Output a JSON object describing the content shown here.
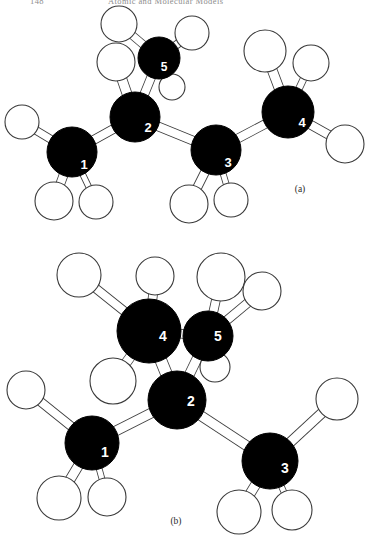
{
  "page": {
    "width": 376,
    "height": 552,
    "background": "#ffffff",
    "ink": "#000000",
    "outline": "#3a3a3a"
  },
  "running_head": {
    "folio": "148",
    "title": "Atomic and Molecular Models"
  },
  "figures": [
    {
      "id": "figure-a",
      "caption": "(a)",
      "caption_x": 300,
      "caption_y": 192,
      "carbon_radius_default": 24,
      "hydrogen_radius_default": 19,
      "carbons": [
        {
          "label": "1",
          "x": 72,
          "y": 152,
          "r": 25,
          "lx": 84,
          "ly": 164,
          "fs": 13
        },
        {
          "label": "2",
          "x": 135,
          "y": 117,
          "r": 25,
          "lx": 148,
          "ly": 127,
          "fs": 13
        },
        {
          "label": "3",
          "x": 216,
          "y": 150,
          "r": 25,
          "lx": 228,
          "ly": 162,
          "fs": 13
        },
        {
          "label": "4",
          "x": 288,
          "y": 112,
          "r": 26,
          "lx": 302,
          "ly": 122,
          "fs": 13
        },
        {
          "label": "5",
          "x": 159,
          "y": 58,
          "r": 21,
          "lx": 164,
          "ly": 67,
          "fs": 12
        }
      ],
      "hydrogens": [
        {
          "x": 22,
          "y": 122,
          "r": 17
        },
        {
          "x": 54,
          "y": 201,
          "r": 19
        },
        {
          "x": 96,
          "y": 202,
          "r": 17
        },
        {
          "x": 116,
          "y": 62,
          "r": 19
        },
        {
          "x": 119,
          "y": 24,
          "r": 18
        },
        {
          "x": 192,
          "y": 33,
          "r": 17
        },
        {
          "x": 172,
          "y": 87,
          "r": 13
        },
        {
          "x": 189,
          "y": 204,
          "r": 19
        },
        {
          "x": 231,
          "y": 200,
          "r": 17
        },
        {
          "x": 265,
          "y": 51,
          "r": 21
        },
        {
          "x": 311,
          "y": 63,
          "r": 18
        },
        {
          "x": 345,
          "y": 144,
          "r": 19
        }
      ],
      "bonds": [
        {
          "a": [
            72,
            152
          ],
          "b": [
            22,
            122
          ],
          "w": 7
        },
        {
          "a": [
            72,
            152
          ],
          "b": [
            54,
            201
          ],
          "w": 8
        },
        {
          "a": [
            72,
            152
          ],
          "b": [
            96,
            202
          ],
          "w": 5
        },
        {
          "a": [
            72,
            152
          ],
          "b": [
            135,
            117
          ],
          "w": 8
        },
        {
          "a": [
            135,
            117
          ],
          "b": [
            116,
            62
          ],
          "w": 9
        },
        {
          "a": [
            135,
            117
          ],
          "b": [
            159,
            58
          ],
          "w": 8
        },
        {
          "a": [
            159,
            58
          ],
          "b": [
            119,
            24
          ],
          "w": 7
        },
        {
          "a": [
            159,
            58
          ],
          "b": [
            192,
            33
          ],
          "w": 7
        },
        {
          "a": [
            159,
            58
          ],
          "b": [
            172,
            87
          ],
          "w": 6
        },
        {
          "a": [
            135,
            117
          ],
          "b": [
            216,
            150
          ],
          "w": 8
        },
        {
          "a": [
            216,
            150
          ],
          "b": [
            189,
            204
          ],
          "w": 8
        },
        {
          "a": [
            216,
            150
          ],
          "b": [
            231,
            200
          ],
          "w": 5
        },
        {
          "a": [
            216,
            150
          ],
          "b": [
            288,
            112
          ],
          "w": 8
        },
        {
          "a": [
            288,
            112
          ],
          "b": [
            265,
            51
          ],
          "w": 9
        },
        {
          "a": [
            288,
            112
          ],
          "b": [
            311,
            63
          ],
          "w": 6
        },
        {
          "a": [
            288,
            112
          ],
          "b": [
            345,
            144
          ],
          "w": 8
        }
      ]
    },
    {
      "id": "figure-b",
      "caption": "(b)",
      "caption_x": 176,
      "caption_y": 524,
      "carbon_radius_default": 27,
      "hydrogen_radius_default": 20,
      "carbons": [
        {
          "label": "1",
          "x": 92,
          "y": 443,
          "r": 27,
          "lx": 105,
          "ly": 452,
          "fs": 14
        },
        {
          "label": "2",
          "x": 177,
          "y": 400,
          "r": 29,
          "lx": 191,
          "ly": 401,
          "fs": 14
        },
        {
          "label": "3",
          "x": 270,
          "y": 461,
          "r": 28,
          "lx": 285,
          "ly": 468,
          "fs": 14
        },
        {
          "label": "4",
          "x": 149,
          "y": 331,
          "r": 32,
          "lx": 163,
          "ly": 336,
          "fs": 14
        },
        {
          "label": "5",
          "x": 208,
          "y": 336,
          "r": 25,
          "lx": 218,
          "ly": 336,
          "fs": 14
        }
      ],
      "hydrogens": [
        {
          "x": 26,
          "y": 390,
          "r": 19
        },
        {
          "x": 59,
          "y": 498,
          "r": 22
        },
        {
          "x": 107,
          "y": 497,
          "r": 19
        },
        {
          "x": 79,
          "y": 275,
          "r": 22
        },
        {
          "x": 155,
          "y": 276,
          "r": 19
        },
        {
          "x": 113,
          "y": 381,
          "r": 23
        },
        {
          "x": 221,
          "y": 277,
          "r": 24
        },
        {
          "x": 262,
          "y": 291,
          "r": 19
        },
        {
          "x": 215,
          "y": 367,
          "r": 15
        },
        {
          "x": 337,
          "y": 399,
          "r": 21
        },
        {
          "x": 239,
          "y": 512,
          "r": 22
        },
        {
          "x": 292,
          "y": 510,
          "r": 20
        }
      ],
      "bonds": [
        {
          "a": [
            92,
            443
          ],
          "b": [
            26,
            390
          ],
          "w": 8
        },
        {
          "a": [
            92,
            443
          ],
          "b": [
            59,
            498
          ],
          "w": 9
        },
        {
          "a": [
            92,
            443
          ],
          "b": [
            107,
            497
          ],
          "w": 5
        },
        {
          "a": [
            92,
            443
          ],
          "b": [
            177,
            400
          ],
          "w": 9
        },
        {
          "a": [
            149,
            331
          ],
          "b": [
            79,
            275
          ],
          "w": 8
        },
        {
          "a": [
            149,
            331
          ],
          "b": [
            155,
            276
          ],
          "w": 8
        },
        {
          "a": [
            149,
            331
          ],
          "b": [
            113,
            381
          ],
          "w": 9
        },
        {
          "a": [
            149,
            331
          ],
          "b": [
            177,
            400
          ],
          "w": 11
        },
        {
          "a": [
            149,
            331
          ],
          "b": [
            208,
            336
          ],
          "w": 8
        },
        {
          "a": [
            208,
            336
          ],
          "b": [
            221,
            277
          ],
          "w": 8
        },
        {
          "a": [
            208,
            336
          ],
          "b": [
            262,
            291
          ],
          "w": 8
        },
        {
          "a": [
            208,
            336
          ],
          "b": [
            215,
            367
          ],
          "w": 6
        },
        {
          "a": [
            208,
            336
          ],
          "b": [
            177,
            400
          ],
          "w": 9
        },
        {
          "a": [
            177,
            400
          ],
          "b": [
            270,
            461
          ],
          "w": 9
        },
        {
          "a": [
            270,
            461
          ],
          "b": [
            337,
            399
          ],
          "w": 9
        },
        {
          "a": [
            270,
            461
          ],
          "b": [
            239,
            512
          ],
          "w": 9
        },
        {
          "a": [
            270,
            461
          ],
          "b": [
            292,
            510
          ],
          "w": 5
        }
      ]
    }
  ]
}
